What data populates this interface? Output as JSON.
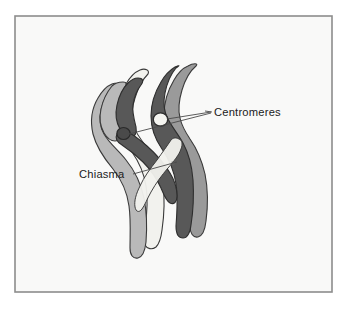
{
  "figure": {
    "background_color": "#ffffff",
    "panel_color": "#f7f7f5",
    "frame_color": "#8d8d8d"
  },
  "labels": {
    "centromeres": "Centromeres",
    "chiasma": "Chiasma"
  },
  "colors": {
    "chromatid_light": "#b9b9b9",
    "chromatid_pale": "#f2f2ee",
    "chromatid_mid": "#9a9a9a",
    "chromatid_dark": "#585858",
    "outline": "#3a3a3a",
    "centromere_light": "#f4f4f0",
    "centromere_dark": "#4a4a4a",
    "leader_line": "#4a4a4a"
  },
  "parts": {
    "centromere_upper": "upper-centromere",
    "centromere_lower": "lower-centromere",
    "chiasma_point": "chiasma-crossover",
    "chromatid_1": "pale-chromatid",
    "chromatid_2": "light-gray-chromatid",
    "chromatid_3": "mid-gray-chromatid",
    "chromatid_4": "dark-gray-chromatid"
  }
}
